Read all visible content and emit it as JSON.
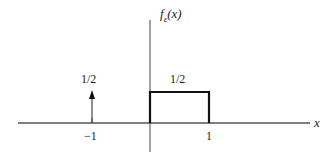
{
  "diagram": {
    "function_label": "f_ε(x)",
    "function_label_main": "f",
    "function_label_sub": "ε",
    "function_label_arg": "(x)",
    "x_axis_label": "x",
    "impulse": {
      "position": -1,
      "weight_label": "1/2"
    },
    "rectangle": {
      "from": 0,
      "to": 1,
      "height_label": "1/2"
    },
    "tick_labels": [
      "−1",
      "1"
    ],
    "colors": {
      "axis": "#555555",
      "curve": "#111111"
    }
  }
}
